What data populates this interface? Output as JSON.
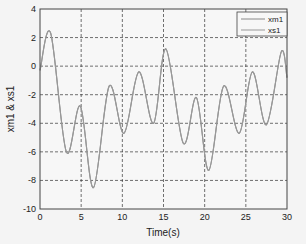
{
  "chart_data": {
    "type": "line",
    "title": "",
    "xlabel": "Time(s)",
    "ylabel": "xm1 & xs1",
    "xlim": [
      0,
      30
    ],
    "ylim": [
      -10,
      4
    ],
    "xticks": [
      0,
      5,
      10,
      15,
      20,
      25,
      30
    ],
    "yticks": [
      -10,
      -8,
      -6,
      -4,
      -2,
      0,
      2,
      4
    ],
    "grid": true,
    "legend_position": "upper right",
    "legend": [
      "xm1",
      "xs1"
    ],
    "series": [
      {
        "name": "xm1",
        "color": "#888888",
        "x": [
          0,
          1.3,
          3.2,
          4.9,
          6.5,
          8.4,
          10.2,
          12.0,
          13.8,
          15.3,
          17.4,
          19.0,
          20.5,
          22.3,
          24.2,
          25.8,
          27.5,
          29.3,
          30
        ],
        "values": [
          -0.3,
          2.3,
          -6.0,
          -2.8,
          -8.5,
          -1.4,
          -4.7,
          -0.4,
          -4.0,
          1.2,
          -5.4,
          -2.2,
          -7.3,
          -1.4,
          -4.7,
          -0.4,
          -4.1,
          1.0,
          -0.8
        ]
      },
      {
        "name": "xs1",
        "color": "#999999",
        "x": [
          0,
          1.3,
          3.2,
          4.9,
          6.5,
          8.4,
          10.2,
          12.0,
          13.8,
          15.3,
          17.4,
          19.0,
          20.5,
          22.3,
          24.2,
          25.8,
          27.5,
          29.3,
          30
        ],
        "values": [
          -0.3,
          2.3,
          -6.0,
          -2.8,
          -8.5,
          -1.4,
          -4.7,
          -0.4,
          -4.0,
          1.2,
          -5.4,
          -2.2,
          -7.3,
          -1.4,
          -4.7,
          -0.4,
          -4.1,
          1.0,
          -0.8
        ]
      }
    ]
  },
  "colors": {
    "background": "#f4f4f4",
    "plot_background": "#f7f7f7",
    "axis": "#444444",
    "grid": "#333333",
    "line": "#8a8a8a"
  }
}
